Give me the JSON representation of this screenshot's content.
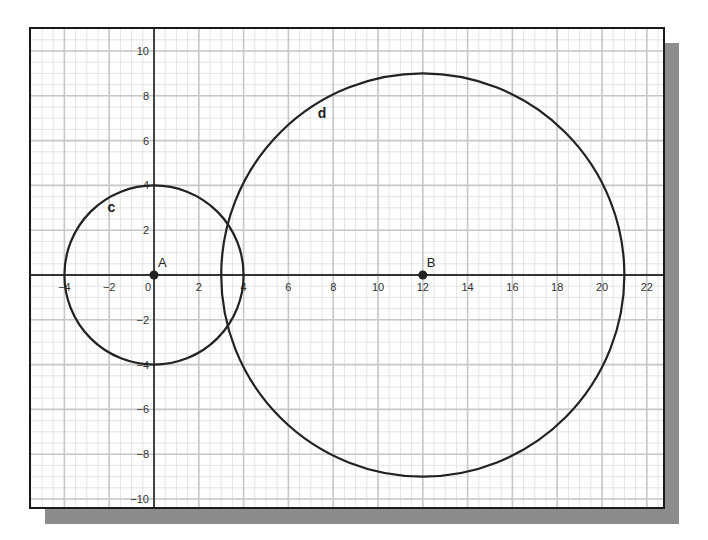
{
  "chart_data": {
    "type": "scatter",
    "title": "",
    "xlabel": "",
    "ylabel": "",
    "xlim": [
      -5.5,
      22.8
    ],
    "ylim": [
      -10.4,
      11
    ],
    "grid": true,
    "minor_grid": true,
    "x_ticks": [
      -4,
      -2,
      0,
      2,
      4,
      6,
      8,
      10,
      12,
      14,
      16,
      18,
      20,
      22
    ],
    "y_ticks": [
      -10,
      -8,
      -6,
      -4,
      -2,
      2,
      4,
      6,
      8,
      10
    ],
    "points": [
      {
        "name": "A",
        "x": 0,
        "y": 0
      },
      {
        "name": "B",
        "x": 12,
        "y": 0
      }
    ],
    "circles": [
      {
        "name": "c",
        "center": "A",
        "cx": 0,
        "cy": 0,
        "r": 4,
        "label_pos": [
          -1.9,
          2.8
        ]
      },
      {
        "name": "d",
        "center": "B",
        "cx": 12,
        "cy": 0,
        "r": 9,
        "label_pos": [
          7.5,
          7.0
        ]
      }
    ],
    "legend": null
  },
  "style": {
    "frame_color": "#1a1a1a",
    "shadow_color": "#8c8c8c",
    "major_grid_color": "#c8c8c8",
    "minor_grid_color": "#e4e4e4",
    "axis_color": "#333333",
    "curve_color": "#222222",
    "tick_label_color": "#333333"
  }
}
